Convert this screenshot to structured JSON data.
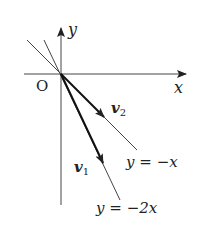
{
  "diagram": {
    "type": "coordinate-plane-vectors",
    "origin_label": "O",
    "x_axis_label": "x",
    "y_axis_label": "y",
    "lines": [
      {
        "equation": "y = −x",
        "lhs": "y",
        "eq": "=",
        "rhs": "−x"
      },
      {
        "equation": "y = −2x",
        "lhs": "y",
        "eq": "=",
        "rhs": "−2x"
      }
    ],
    "vectors": [
      {
        "name": "v",
        "sub": "2",
        "along": "y = −x"
      },
      {
        "name": "v",
        "sub": "1",
        "along": "y = −2x"
      }
    ],
    "colors": {
      "ink": "#222222",
      "background": "#ffffff"
    }
  }
}
